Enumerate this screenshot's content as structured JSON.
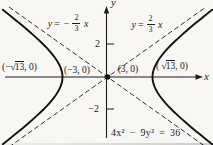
{
  "graph": {
    "type": "function-plot",
    "equation_label": "4x² − 9y² = 36",
    "hyperbola": {
      "a": 3,
      "b": 2
    },
    "vertices": [
      "(−3, 0)",
      "(3, 0)"
    ],
    "foci": [
      "(−√13, 0)",
      "(√13, 0)"
    ],
    "asymptotes": [
      "y = −(2/3)x",
      "y = (2/3)x"
    ],
    "y_ticks": [
      2,
      -2
    ],
    "x_axis_label": "x",
    "y_axis_label": "y"
  },
  "labels": {
    "axis_x": "x",
    "axis_y": "y",
    "tick_pos": "2",
    "tick_neg": "−2",
    "asym_left": {
      "y": "y",
      "equals": "=",
      "sign": "−",
      "num": "2",
      "den": "3",
      "x": "x"
    },
    "asym_right": {
      "y": "y",
      "equals": "=",
      "num": "2",
      "den": "3",
      "x": "x"
    },
    "focus_left": {
      "pre": "(−",
      "sqrt": "√",
      "rad": "13",
      "post": ", 0)"
    },
    "vertex_left": "(−3, 0)",
    "vertex_right": "(3, 0)",
    "focus_right": {
      "pre": "( ",
      "sqrt": "√",
      "rad": "13",
      "post": ", 0)"
    },
    "equation": "4x² − 9y² = 36"
  }
}
